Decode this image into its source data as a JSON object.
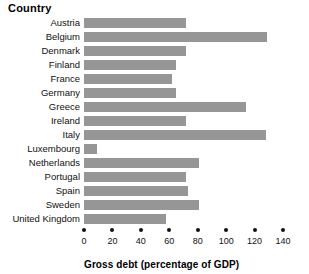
{
  "header": {
    "country_label": "Country"
  },
  "axis": {
    "title": "Gross debt (percentage of GDP)",
    "ticks": [
      "0",
      "20",
      "40",
      "60",
      "80",
      "100",
      "120",
      "140"
    ]
  },
  "style": {
    "bar_color": "#969696",
    "text_color": "#111111",
    "background": "#ffffff"
  },
  "chart_data": {
    "type": "bar",
    "orientation": "horizontal",
    "title": "",
    "xlabel": "Gross debt (percentage of GDP)",
    "ylabel": "Country",
    "xlim": [
      0,
      140
    ],
    "xticks": [
      0,
      20,
      40,
      60,
      80,
      100,
      120,
      140
    ],
    "grid": false,
    "legend": false,
    "categories": [
      "Austria",
      "Belgium",
      "Denmark",
      "Finland",
      "France",
      "Germany",
      "Greece",
      "Ireland",
      "Italy",
      "Luxembourg",
      "Netherlands",
      "Portugal",
      "Spain",
      "Sweden",
      "United Kingdom"
    ],
    "values": [
      72,
      129,
      72,
      65,
      62,
      65,
      114,
      72,
      128,
      9,
      81,
      72,
      73,
      81,
      58
    ]
  }
}
